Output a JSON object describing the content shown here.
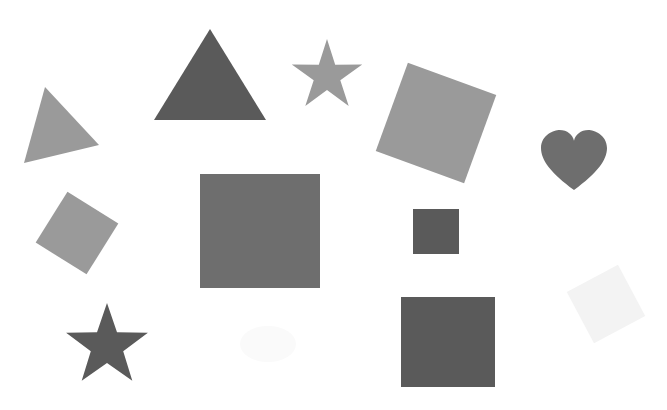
{
  "canvas": {
    "width": 667,
    "height": 410,
    "background": "#ffffff"
  },
  "colors": {
    "dark": "#5a5a5a",
    "medium": "#6e6e6e",
    "light": "#9a9a9a",
    "faint": "#f3f3f3",
    "ghost": "#fafafa"
  },
  "shapes": [
    {
      "id": "triangle-large",
      "type": "triangle",
      "shade": "dark",
      "points": [
        [
          210,
          29
        ],
        [
          266,
          120
        ],
        [
          154,
          120
        ]
      ]
    },
    {
      "id": "triangle-small-rotated",
      "type": "triangle",
      "shade": "light",
      "points": [
        [
          45,
          87
        ],
        [
          99,
          145
        ],
        [
          24,
          163
        ]
      ]
    },
    {
      "id": "star-top",
      "type": "star",
      "shade": "light",
      "cx": 327,
      "cy": 76,
      "outer": 37,
      "inner": 14,
      "rotation": 0
    },
    {
      "id": "star-bottom",
      "type": "star",
      "shade": "dark",
      "cx": 107,
      "cy": 346,
      "outer": 43,
      "inner": 17,
      "rotation": 0
    },
    {
      "id": "square-rotated-top",
      "type": "rotated-square",
      "shade": "light",
      "cx": 436,
      "cy": 123,
      "size": 94,
      "rotation": 20
    },
    {
      "id": "square-rotated-left",
      "type": "rotated-square",
      "shade": "light",
      "cx": 77,
      "cy": 233,
      "size": 60,
      "rotation": 32
    },
    {
      "id": "square-large-center",
      "type": "square",
      "shade": "medium",
      "x": 200,
      "y": 174,
      "w": 120,
      "h": 114
    },
    {
      "id": "square-small-center",
      "type": "square",
      "shade": "dark",
      "x": 413,
      "y": 209,
      "w": 46,
      "h": 45
    },
    {
      "id": "square-bottom-right",
      "type": "square",
      "shade": "dark",
      "x": 401,
      "y": 297,
      "w": 94,
      "h": 90
    },
    {
      "id": "square-faint-rotated",
      "type": "rotated-square",
      "shade": "faint",
      "cx": 606,
      "cy": 304,
      "size": 58,
      "rotation": -28
    },
    {
      "id": "heart",
      "type": "heart",
      "shade": "medium",
      "cx": 574,
      "cy": 160,
      "w": 66,
      "h": 60
    },
    {
      "id": "faint-blob",
      "type": "blob",
      "shade": "ghost",
      "cx": 268,
      "cy": 344,
      "rx": 28,
      "ry": 18
    }
  ]
}
